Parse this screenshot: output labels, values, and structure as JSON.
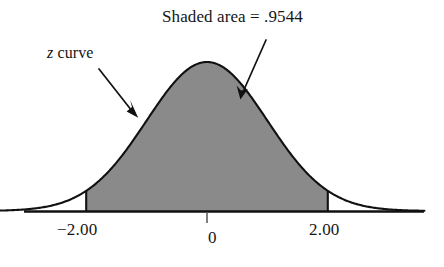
{
  "figure": {
    "title": "Shaded area = .9544",
    "curve_label_variable": "z",
    "curve_label_rest": " curve"
  },
  "axis": {
    "ticks": [
      {
        "label": "−2.00",
        "value": -2.0
      },
      {
        "label": "0",
        "value": 0.0
      },
      {
        "label": "2.00",
        "value": 2.0
      }
    ]
  },
  "colors": {
    "shade_fill": "#8a8a8a",
    "curve_stroke": "#111111",
    "axis_stroke": "#111111",
    "text": "#161616"
  },
  "chart_data": {
    "type": "area",
    "title": "Shaded area = .9544",
    "xlabel": "",
    "ylabel": "",
    "distribution": "standard normal (z curve)",
    "mean": 0,
    "sd": 1,
    "xlim": [
      -3.6,
      3.6
    ],
    "ylim": [
      0,
      0.42
    ],
    "grid": false,
    "legend": null,
    "tick_values": [
      -2.0,
      0,
      2.0
    ],
    "tick_labels": [
      "−2.00",
      "0",
      "2.00"
    ],
    "shaded_region": {
      "from": -2.0,
      "to": 2.0,
      "area": 0.9544,
      "area_label": ".9544",
      "fill": "#8a8a8a"
    },
    "boundary_markers": [
      -2.0,
      2.0
    ],
    "annotations": [
      {
        "text": "Shaded area = .9544",
        "points_to": "shaded region interior",
        "arrow_from_x": 3.0,
        "arrow_to_x": 0.55
      },
      {
        "text": "z curve",
        "points_to": "curve outline left flank",
        "arrow_from_x": -2.6,
        "arrow_to_x": -1.55
      }
    ],
    "x": [
      -3.6,
      -3.4,
      -3.2,
      -3.0,
      -2.8,
      -2.6,
      -2.4,
      -2.2,
      -2.0,
      -1.8,
      -1.6,
      -1.4,
      -1.2,
      -1.0,
      -0.8,
      -0.6,
      -0.4,
      -0.2,
      0.0,
      0.2,
      0.4,
      0.6,
      0.8,
      1.0,
      1.2,
      1.4,
      1.6,
      1.8,
      2.0,
      2.2,
      2.4,
      2.6,
      2.8,
      3.0,
      3.2,
      3.4,
      3.6
    ],
    "y": [
      0.0006,
      0.0012,
      0.0024,
      0.0044,
      0.0079,
      0.0136,
      0.0224,
      0.0355,
      0.054,
      0.079,
      0.1109,
      0.1497,
      0.1942,
      0.242,
      0.2897,
      0.3332,
      0.3683,
      0.391,
      0.3989,
      0.391,
      0.3683,
      0.3332,
      0.2897,
      0.242,
      0.1942,
      0.1497,
      0.1109,
      0.079,
      0.054,
      0.0355,
      0.0224,
      0.0136,
      0.0079,
      0.0044,
      0.0024,
      0.0012,
      0.0006
    ]
  }
}
